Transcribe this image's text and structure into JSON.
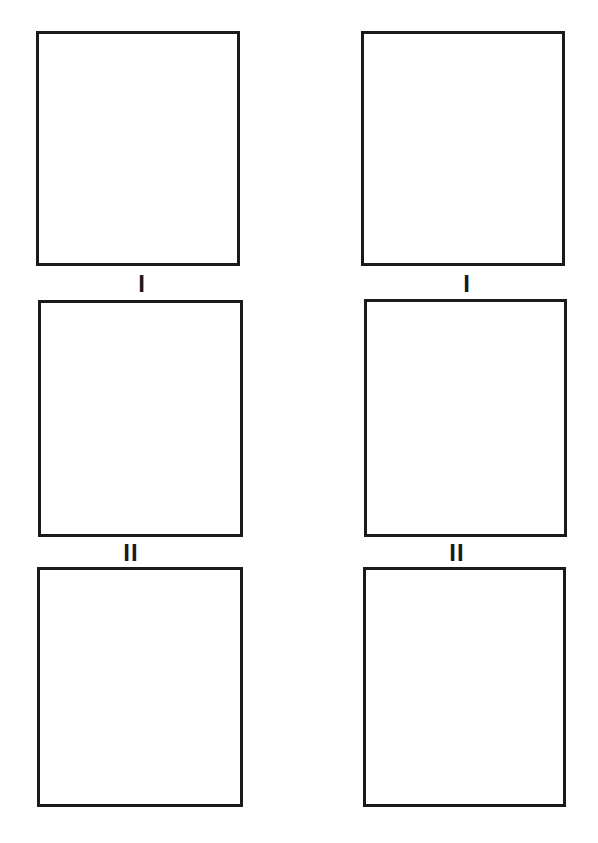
{
  "columns": [
    {
      "boxes": [
        {
          "id": "left-box-1",
          "x": 36,
          "y": 31,
          "w": 204,
          "h": 235
        },
        {
          "id": "left-box-2",
          "x": 38,
          "y": 300,
          "w": 205,
          "h": 237
        },
        {
          "id": "left-box-3",
          "x": 37,
          "y": 567,
          "w": 206,
          "h": 240
        }
      ],
      "labels": [
        {
          "id": "left-label-1",
          "text": "I",
          "cx": 142,
          "y": 274
        },
        {
          "id": "left-label-2",
          "text": "II",
          "cx": 131,
          "y": 543
        }
      ]
    },
    {
      "boxes": [
        {
          "id": "right-box-1",
          "x": 361,
          "y": 31,
          "w": 204,
          "h": 235
        },
        {
          "id": "right-box-2",
          "x": 364,
          "y": 299,
          "w": 203,
          "h": 238
        },
        {
          "id": "right-box-3",
          "x": 363,
          "y": 567,
          "w": 203,
          "h": 240
        }
      ],
      "labels": [
        {
          "id": "right-label-1",
          "text": "I",
          "cx": 467,
          "y": 274
        },
        {
          "id": "right-label-2",
          "text": "II",
          "cx": 457,
          "y": 543
        }
      ]
    }
  ],
  "colors": {
    "stroke": "#1a1a1a",
    "background": "#ffffff"
  }
}
